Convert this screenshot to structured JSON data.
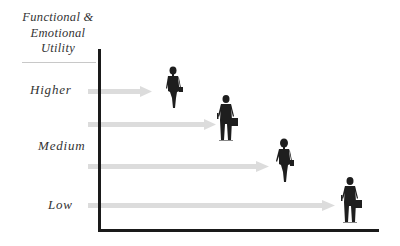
{
  "title": {
    "line1": "Functional &",
    "line2": "Emotional",
    "line3": "Utility"
  },
  "levels": [
    {
      "label": "Higher"
    },
    {
      "label": "Medium"
    },
    {
      "label": "Low"
    }
  ],
  "arrows": [
    {
      "y": 91,
      "x_start": 88,
      "x_end": 150
    },
    {
      "y": 124,
      "x_start": 88,
      "x_end": 215
    },
    {
      "y": 166,
      "x_start": 88,
      "x_end": 268
    },
    {
      "y": 205,
      "x_start": 88,
      "x_end": 335
    }
  ],
  "figures": [
    {
      "type": "businesswoman",
      "x": 172,
      "y": 68
    },
    {
      "type": "businessman",
      "x": 225,
      "y": 96
    },
    {
      "type": "businesswoman",
      "x": 283,
      "y": 140
    },
    {
      "type": "businessman",
      "x": 349,
      "y": 178
    }
  ],
  "colors": {
    "axis": "#1a1a1a",
    "arrow": "#d9d9d9",
    "text": "#333333",
    "figure": "#1e1e1e"
  }
}
